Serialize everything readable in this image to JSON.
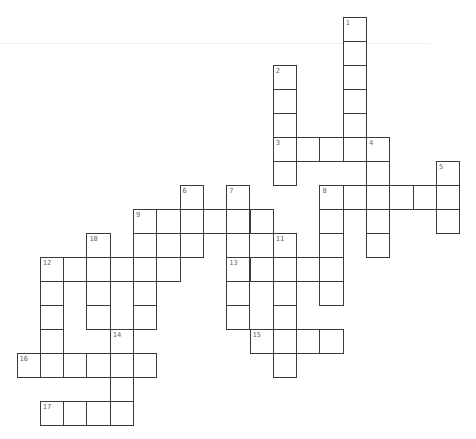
{
  "puzzle": {
    "cell_width": 23.3,
    "cell_height": 24,
    "origin_x": 16.5,
    "origin_y": 17,
    "border_color": "#3a3a3a",
    "number_color": "#666666",
    "words": [
      {
        "number": "1",
        "direction": "down",
        "col": 14,
        "row": 0,
        "length": 6
      },
      {
        "number": "2",
        "direction": "down",
        "col": 11,
        "row": 2,
        "length": 5
      },
      {
        "number": "3",
        "direction": "across",
        "col": 11,
        "row": 5,
        "length": 5
      },
      {
        "number": "4",
        "direction": "down",
        "col": 15,
        "row": 5,
        "length": 5
      },
      {
        "number": "5",
        "direction": "down",
        "col": 18,
        "row": 6,
        "length": 3
      },
      {
        "number": "6",
        "direction": "down",
        "col": 7,
        "row": 7,
        "length": 3
      },
      {
        "number": "7",
        "direction": "down",
        "col": 9,
        "row": 7,
        "length": 6
      },
      {
        "number": "8",
        "direction": "across",
        "col": 13,
        "row": 7,
        "length": 6
      },
      {
        "number": "8",
        "direction": "down",
        "col": 13,
        "row": 7,
        "length": 5
      },
      {
        "number": "9",
        "direction": "across",
        "col": 5,
        "row": 8,
        "length": 6
      },
      {
        "number": "9",
        "direction": "down",
        "col": 5,
        "row": 8,
        "length": 5
      },
      {
        "number": "",
        "direction": "down",
        "col": 6,
        "row": 8,
        "length": 3
      },
      {
        "number": "10",
        "direction": "down",
        "col": 3,
        "row": 9,
        "length": 4
      },
      {
        "number": "11",
        "direction": "down",
        "col": 11,
        "row": 9,
        "length": 6
      },
      {
        "number": "12",
        "direction": "across",
        "col": 1,
        "row": 10,
        "length": 6
      },
      {
        "number": "12",
        "direction": "down",
        "col": 1,
        "row": 10,
        "length": 5
      },
      {
        "number": "13",
        "direction": "across",
        "col": 9,
        "row": 10,
        "length": 5
      },
      {
        "number": "14",
        "direction": "down",
        "col": 4,
        "row": 13,
        "length": 4
      },
      {
        "number": "15",
        "direction": "across",
        "col": 10,
        "row": 13,
        "length": 4
      },
      {
        "number": "16",
        "direction": "across",
        "col": 0,
        "row": 14,
        "length": 6
      },
      {
        "number": "17",
        "direction": "across",
        "col": 1,
        "row": 16,
        "length": 4
      }
    ]
  }
}
